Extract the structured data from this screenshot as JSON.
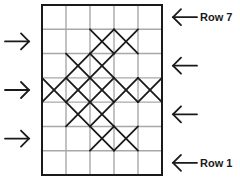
{
  "diagram": {
    "type": "knitting-chart",
    "columns": 5,
    "rows": 7,
    "row_labels": [
      {
        "row": 7,
        "text": "Row 7"
      },
      {
        "row": 1,
        "text": "Row 1"
      }
    ],
    "stitch_symbol": "cross",
    "marked_cells": [
      {
        "row": 6,
        "cols": [
          3,
          4
        ]
      },
      {
        "row": 5,
        "cols": [
          2,
          3
        ]
      },
      {
        "row": 4,
        "cols": [
          1,
          2,
          3,
          4,
          5
        ]
      },
      {
        "row": 3,
        "cols": [
          2,
          3
        ]
      },
      {
        "row": 2,
        "cols": [
          3,
          4
        ]
      }
    ],
    "direction_arrows": [
      {
        "row": 7,
        "side": "right",
        "points": "left"
      },
      {
        "row": 6,
        "side": "left",
        "points": "right"
      },
      {
        "row": 5,
        "side": "right",
        "points": "left"
      },
      {
        "row": 4,
        "side": "left",
        "points": "right"
      },
      {
        "row": 3,
        "side": "right",
        "points": "left"
      },
      {
        "row": 2,
        "side": "left",
        "points": "right"
      },
      {
        "row": 1,
        "side": "right",
        "points": "left"
      }
    ],
    "colors": {
      "grid_line": "#a8a8a8",
      "border": "#1a1a1a",
      "stitch": "#1a1a1a",
      "arrow": "#1a1a1a"
    }
  }
}
